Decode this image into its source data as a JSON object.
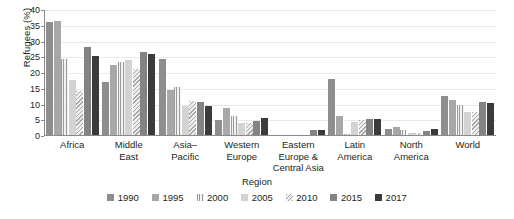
{
  "chart_data": {
    "type": "bar",
    "title": "",
    "xlabel": "Region",
    "ylabel": "Refugees (%)",
    "ylim": [
      0,
      40
    ],
    "yticks": [
      0,
      5,
      10,
      15,
      20,
      25,
      30,
      35,
      40
    ],
    "grid": true,
    "legend_position": "bottom",
    "categories": [
      "Africa",
      "Middle East",
      "Asia–Pacific",
      "Western Europe",
      "Eastern Europe & Central Asia",
      "Latin America",
      "North America",
      "World"
    ],
    "category_lines": [
      [
        "Africa"
      ],
      [
        "Middle",
        "East"
      ],
      [
        "Asia–",
        "Pacific"
      ],
      [
        "Western",
        "Europe"
      ],
      [
        "Eastern",
        "Europe &",
        "Central Asia"
      ],
      [
        "Latin",
        "America"
      ],
      [
        "North",
        "America"
      ],
      [
        "World"
      ]
    ],
    "series": [
      {
        "name": "1990",
        "color": "#8e8e90",
        "values": [
          36.3,
          17.0,
          24.4,
          5.0,
          0.2,
          18.0,
          2.3,
          12.7
        ]
      },
      {
        "name": "1995",
        "color": "#a8a8aa",
        "values": [
          36.5,
          22.6,
          14.7,
          8.8,
          0.3,
          6.3,
          2.8,
          11.5
        ]
      },
      {
        "name": "2000",
        "color": "#f2f2f2",
        "values": [
          24.3,
          23.5,
          15.7,
          6.5,
          0.3,
          0.6,
          1.9,
          9.7
        ]
      },
      {
        "name": "2005",
        "color": "#d3d3d5",
        "values": [
          17.8,
          24.0,
          9.5,
          4.2,
          0.3,
          4.5,
          0.9,
          7.6
        ]
      },
      {
        "name": "2010",
        "color": "#efefef",
        "values": [
          14.2,
          21.2,
          11.0,
          4.0,
          0.4,
          5.2,
          1.1,
          7.6
        ]
      },
      {
        "name": "2015",
        "color": "#838386",
        "values": [
          28.3,
          26.6,
          10.7,
          4.8,
          2.0,
          5.3,
          1.7,
          10.8
        ]
      },
      {
        "name": "2017",
        "color": "#3b3b3d",
        "values": [
          25.5,
          26.0,
          9.5,
          5.7,
          1.9,
          5.3,
          2.1,
          10.6
        ]
      }
    ]
  },
  "legend": {
    "title": "Region",
    "items": [
      {
        "label": "1990"
      },
      {
        "label": "1995"
      },
      {
        "label": "2000"
      },
      {
        "label": "2005"
      },
      {
        "label": "2010"
      },
      {
        "label": "2015"
      },
      {
        "label": "2017"
      }
    ]
  }
}
